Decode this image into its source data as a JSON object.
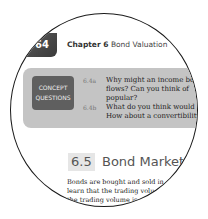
{
  "header": {
    "page_number": "164",
    "page_number_visible": "64",
    "chapter_label": "Chapter 6",
    "chapter_title": "Bond Valuation"
  },
  "concept_questions": {
    "badge_line1": "CONCEPT",
    "badge_line2": "QUESTIONS",
    "items": [
      {
        "num": "6.4a",
        "lines": [
          "Why might an income bon",
          "flows? Can you think of",
          "popular?"
        ]
      },
      {
        "num": "6.4b",
        "lines": [
          "What do you think would b",
          "How about a convertibility"
        ]
      }
    ]
  },
  "section": {
    "number": "6.5",
    "title": "Bond Markets",
    "body_lines": [
      "Bonds are bought and sold in",
      "learn that the trading volu",
      "the trading volume is"
    ]
  },
  "colors": {
    "box_bg": "#c4c4c4",
    "badge_bg": "#5f5f5f",
    "lens_border": "#1a1a1a"
  }
}
